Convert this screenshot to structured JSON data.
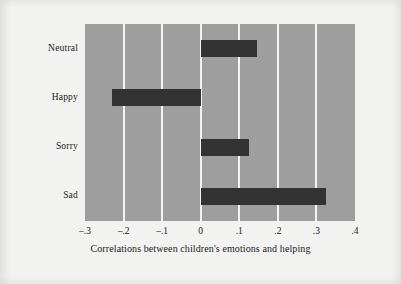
{
  "chart_data": {
    "type": "bar",
    "orientation": "horizontal",
    "title": "",
    "xlabel": "Correlations between children's emotions and helping",
    "ylabel": "",
    "categories": [
      "Neutral",
      "Happy",
      "Sorry",
      "Sad"
    ],
    "values": [
      0.145,
      -0.23,
      0.125,
      0.325
    ],
    "xlim": [
      -0.3,
      0.4
    ],
    "xticks": [
      -0.3,
      -0.2,
      -0.1,
      0,
      0.1,
      0.2,
      0.3,
      0.4
    ],
    "xtick_labels": [
      "–.3",
      "–.2",
      "–.1",
      "0",
      ".1",
      ".2",
      ".3",
      ".4"
    ],
    "grid": true,
    "grid_axis": "x",
    "legend": "none",
    "colors": {
      "bar": "#333333",
      "panel_background": "#9e9e9e",
      "figure_background": "#f2f2f0",
      "gridline": "#f4f4f2",
      "text": "#1b1b1b"
    }
  }
}
